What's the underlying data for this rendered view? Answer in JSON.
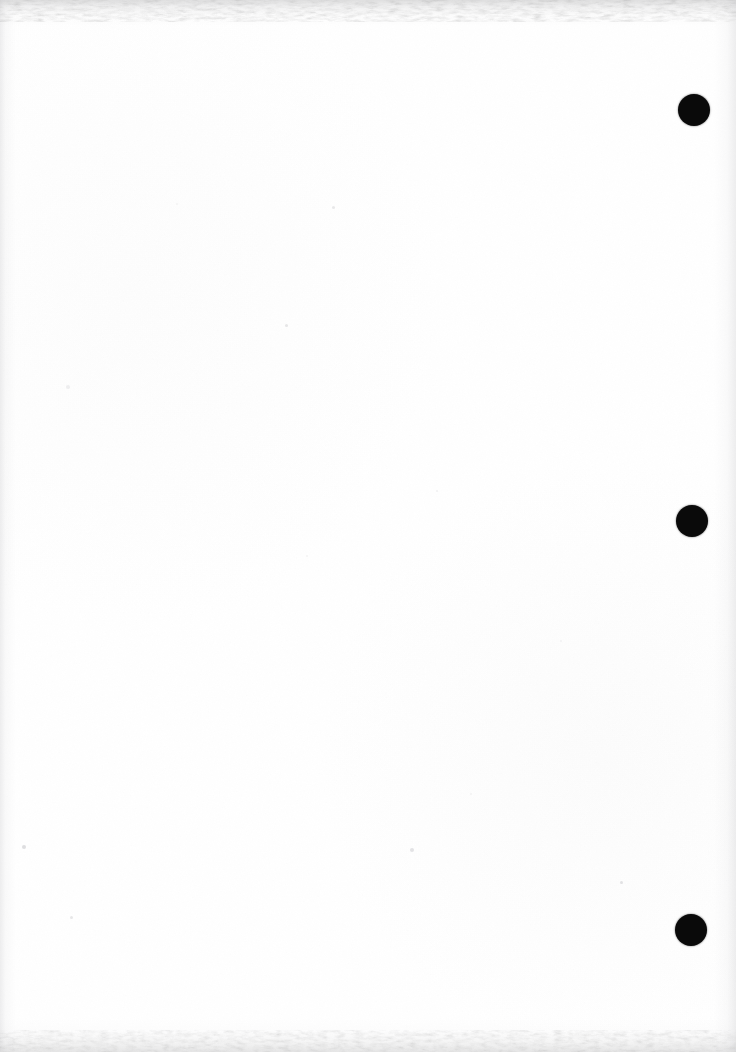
{
  "document": {
    "kind": "scanned-blank-page",
    "page_width": 736,
    "page_height": 1052,
    "page_color": "#ffffff",
    "ink_color": "#0a0a0a",
    "body_text": "",
    "visible_text": ""
  },
  "marks": {
    "label": "fiducial-marks",
    "shape": "filled-circle",
    "color": "#0a0a0a",
    "count": 3,
    "items": [
      {
        "name": "fiducial-dot-top",
        "cx": 694,
        "cy": 110,
        "d": 32
      },
      {
        "name": "fiducial-dot-middle",
        "cx": 692,
        "cy": 521,
        "d": 32
      },
      {
        "name": "fiducial-dot-bottom",
        "cx": 691,
        "cy": 930,
        "d": 32
      }
    ]
  },
  "artifacts": {
    "label": "scan-artifacts",
    "speck_color": "#b9b9bd",
    "specks": [
      {
        "x": 332,
        "y": 206,
        "s": 3,
        "o": 0.3
      },
      {
        "x": 285,
        "y": 324,
        "s": 3,
        "o": 0.34
      },
      {
        "x": 66,
        "y": 385,
        "s": 4,
        "o": 0.22
      },
      {
        "x": 436,
        "y": 490,
        "s": 2,
        "o": 0.18
      },
      {
        "x": 306,
        "y": 555,
        "s": 2,
        "o": 0.16
      },
      {
        "x": 22,
        "y": 845,
        "s": 4,
        "o": 0.45
      },
      {
        "x": 410,
        "y": 848,
        "s": 4,
        "o": 0.38
      },
      {
        "x": 620,
        "y": 881,
        "s": 3,
        "o": 0.4
      },
      {
        "x": 70,
        "y": 916,
        "s": 3,
        "o": 0.33
      },
      {
        "x": 470,
        "y": 793,
        "s": 2,
        "o": 0.16
      },
      {
        "x": 176,
        "y": 203,
        "s": 2,
        "o": 0.15
      },
      {
        "x": 560,
        "y": 640,
        "s": 2,
        "o": 0.14
      }
    ]
  }
}
